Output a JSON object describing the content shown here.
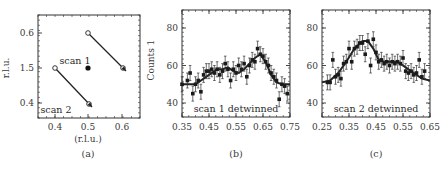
{
  "chart_data": [
    {
      "id": "a",
      "type": "scatter",
      "panel_label": "(a)",
      "xlabel": "(r.l.u.)",
      "ylabel": "r.l.u.",
      "xlim": [
        0.35,
        0.65
      ],
      "xticks": [
        "0.4",
        "0.5",
        "0.6"
      ],
      "yticks": [
        "0.6",
        "1.5",
        "0.4"
      ],
      "points": [
        {
          "x": 0.5,
          "y": "1.5",
          "label": "scan 1"
        }
      ],
      "arrows": [
        {
          "name": "scan 1",
          "from": [
            0.5,
            "0.6"
          ],
          "to": [
            0.6,
            "1.5"
          ]
        },
        {
          "name": "scan 2",
          "from": [
            0.4,
            "1.5"
          ],
          "to": [
            0.5,
            "0.4"
          ]
        }
      ],
      "annotations": [
        "scan 1",
        "scan 2"
      ]
    },
    {
      "id": "b",
      "type": "scatter",
      "panel_label": "(b)",
      "ylabel": "Counts 1",
      "xlabel": "",
      "xlim": [
        0.35,
        0.75
      ],
      "ylim": [
        32,
        90
      ],
      "xticks": [
        "0.35",
        "0.45",
        "0.55",
        "0.65",
        "0.75"
      ],
      "yticks": [
        "40",
        "60",
        "80"
      ],
      "annotation": "scan 1 detwinned",
      "series": [
        {
          "name": "data",
          "x": [
            0.35,
            0.37,
            0.38,
            0.39,
            0.4,
            0.41,
            0.42,
            0.43,
            0.44,
            0.45,
            0.46,
            0.47,
            0.48,
            0.49,
            0.5,
            0.51,
            0.52,
            0.53,
            0.54,
            0.55,
            0.56,
            0.57,
            0.58,
            0.59,
            0.6,
            0.61,
            0.62,
            0.63,
            0.64,
            0.65,
            0.66,
            0.67,
            0.68,
            0.69,
            0.7,
            0.71,
            0.72,
            0.73,
            0.74
          ],
          "y": [
            50,
            52,
            56,
            45,
            50,
            52,
            46,
            55,
            57,
            57,
            58,
            56,
            58,
            55,
            57,
            61,
            58,
            52,
            58,
            56,
            60,
            58,
            61,
            54,
            60,
            63,
            62,
            69,
            66,
            65,
            62,
            60,
            56,
            54,
            52,
            42,
            50,
            49,
            45
          ],
          "err": 4
        },
        {
          "name": "fit",
          "x": [
            0.35,
            0.4,
            0.45,
            0.48,
            0.5,
            0.52,
            0.54,
            0.56,
            0.58,
            0.6,
            0.62,
            0.64,
            0.66,
            0.68,
            0.7,
            0.72,
            0.75
          ],
          "y": [
            50,
            50,
            55,
            58,
            58,
            59,
            57,
            56,
            58,
            61,
            64,
            66,
            62,
            55,
            51,
            50,
            50
          ]
        }
      ]
    },
    {
      "id": "c",
      "type": "scatter",
      "panel_label": "(c)",
      "ylabel": "",
      "xlabel": "",
      "xlim": [
        0.25,
        0.65
      ],
      "ylim": [
        32,
        90
      ],
      "xticks": [
        "0.25",
        "0.35",
        "0.45",
        "0.55",
        "0.65"
      ],
      "yticks": [
        "40",
        "60",
        "80"
      ],
      "annotation": "scan 2 detwinned",
      "series": [
        {
          "name": "data",
          "x": [
            0.27,
            0.28,
            0.29,
            0.3,
            0.31,
            0.32,
            0.33,
            0.34,
            0.35,
            0.36,
            0.37,
            0.38,
            0.39,
            0.4,
            0.41,
            0.42,
            0.43,
            0.44,
            0.45,
            0.46,
            0.47,
            0.48,
            0.49,
            0.5,
            0.51,
            0.52,
            0.53,
            0.54,
            0.55,
            0.56,
            0.57,
            0.58,
            0.59,
            0.6,
            0.61,
            0.62,
            0.63
          ],
          "y": [
            51,
            51,
            63,
            54,
            55,
            53,
            61,
            62,
            69,
            62,
            69,
            70,
            72,
            72,
            66,
            73,
            60,
            74,
            67,
            62,
            63,
            61,
            62,
            60,
            62,
            61,
            62,
            61,
            64,
            57,
            56,
            57,
            55,
            56,
            63,
            54,
            57
          ],
          "err": 4
        },
        {
          "name": "fit",
          "x": [
            0.25,
            0.28,
            0.31,
            0.34,
            0.37,
            0.4,
            0.42,
            0.44,
            0.46,
            0.48,
            0.5,
            0.53,
            0.56,
            0.59,
            0.62,
            0.65
          ],
          "y": [
            51,
            52,
            56,
            62,
            69,
            73,
            73,
            69,
            63,
            62,
            62,
            62,
            59,
            56,
            53,
            52
          ]
        }
      ]
    }
  ]
}
